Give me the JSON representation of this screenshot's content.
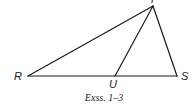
{
  "figure": {
    "caption": "Exss. 1–3",
    "points": {
      "T": {
        "label": "T",
        "x": 153,
        "y": 6
      },
      "R": {
        "label": "R",
        "x": 28,
        "y": 76
      },
      "S": {
        "label": "S",
        "x": 177,
        "y": 76
      },
      "U": {
        "label": "U",
        "x": 115,
        "y": 76
      }
    },
    "segments": [
      {
        "name": "RT",
        "from": "R",
        "to": "T"
      },
      {
        "name": "TS",
        "from": "T",
        "to": "S"
      },
      {
        "name": "RS",
        "from": "R",
        "to": "S"
      },
      {
        "name": "TU",
        "from": "T",
        "to": "U"
      }
    ],
    "line_color": "#1a1a1a"
  }
}
